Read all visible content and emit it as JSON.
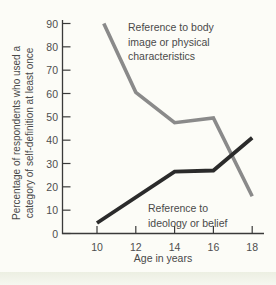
{
  "figure": {
    "background_color": "#fcfcf7",
    "edge_band_color": "#ecefe2",
    "axis_color": "#3a3a3a",
    "text_color": "#4a4a4a"
  },
  "chart_data": {
    "type": "line",
    "title": "",
    "xlabel": "Age in years",
    "ylabel": "Percentage of respondents who used a category of self-definition at least once",
    "ylabel_line1": "Percentage of respondents who used a",
    "ylabel_line2": "category of self-definition at least once",
    "x_ticks": [
      10,
      12,
      14,
      16,
      18
    ],
    "y_ticks": [
      0,
      10,
      20,
      30,
      40,
      50,
      60,
      70,
      80,
      90
    ],
    "xlim": [
      9,
      19
    ],
    "ylim": [
      0,
      90
    ],
    "grid": false,
    "legend": "inline-annotations",
    "series": [
      {
        "name": "Reference to body image or physical characteristics",
        "label_line1": "Reference to body",
        "label_line2": "image or physical",
        "label_line3": "characteristics",
        "color": "#8a8a8a",
        "stroke_width": 3.6,
        "x": [
          10.35,
          12,
          14,
          16,
          18
        ],
        "values": [
          90,
          60.5,
          47.5,
          49.5,
          16
        ]
      },
      {
        "name": "Reference to ideology or belief",
        "label_line1": "Reference to",
        "label_line2": "ideology or belief",
        "color": "#2b2b2b",
        "stroke_width": 3.8,
        "x": [
          10,
          14,
          16,
          18
        ],
        "values": [
          4.5,
          26.5,
          27,
          41
        ]
      }
    ]
  }
}
